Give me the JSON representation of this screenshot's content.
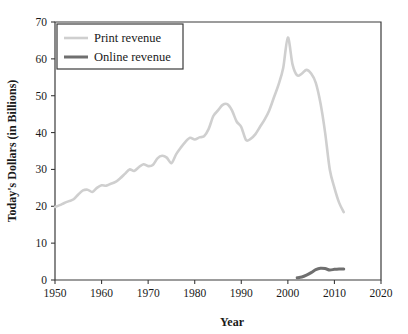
{
  "chart_data": {
    "type": "line",
    "title": "",
    "xlabel": "Year",
    "ylabel": "Today's Dollars (in Billions)",
    "xlim": [
      1950,
      2020
    ],
    "ylim": [
      0,
      70
    ],
    "xticks": [
      1950,
      1960,
      1970,
      1980,
      1990,
      2000,
      2010,
      2020
    ],
    "xtick_labels": [
      "1950",
      "1960",
      "1970",
      "1980",
      "1990",
      "2000",
      "2010",
      "2020"
    ],
    "yticks": [
      0,
      10,
      20,
      30,
      40,
      50,
      60,
      70
    ],
    "ytick_labels": [
      "0",
      "10",
      "20",
      "30",
      "40",
      "50",
      "60",
      "70"
    ],
    "grid": false,
    "legend_position": "upper-left",
    "series": [
      {
        "name": "Print revenue",
        "color": "#cfcfcf",
        "width": 2.6,
        "x": [
          1950,
          1951,
          1952,
          1953,
          1954,
          1955,
          1956,
          1957,
          1958,
          1959,
          1960,
          1961,
          1962,
          1963,
          1964,
          1965,
          1966,
          1967,
          1968,
          1969,
          1970,
          1971,
          1972,
          1973,
          1974,
          1975,
          1976,
          1977,
          1978,
          1979,
          1980,
          1981,
          1982,
          1983,
          1984,
          1985,
          1986,
          1987,
          1988,
          1989,
          1990,
          1991,
          1992,
          1993,
          1994,
          1995,
          1996,
          1997,
          1998,
          1999,
          2000,
          2001,
          2002,
          2003,
          2004,
          2005,
          2006,
          2007,
          2008,
          2009,
          2010,
          2011,
          2012
        ],
        "y": [
          19.8,
          20.3,
          20.9,
          21.4,
          21.9,
          23.2,
          24.3,
          24.5,
          23.9,
          25.0,
          25.7,
          25.6,
          26.1,
          26.6,
          27.6,
          28.8,
          30.0,
          29.6,
          30.6,
          31.4,
          30.9,
          31.2,
          33.0,
          33.7,
          33.2,
          31.7,
          34.1,
          35.9,
          37.5,
          38.6,
          38.1,
          38.7,
          39.0,
          41.0,
          44.5,
          46.0,
          47.5,
          47.7,
          46.0,
          43.0,
          41.5,
          38.0,
          38.3,
          39.5,
          41.5,
          43.5,
          46.0,
          49.5,
          53.0,
          57.5,
          65.8,
          58.5,
          55.5,
          56.0,
          57.0,
          56.0,
          53.5,
          48.0,
          40.0,
          30.0,
          25.0,
          21.0,
          18.4
        ]
      },
      {
        "name": "Online revenue",
        "color": "#6f6f6f",
        "width": 3.0,
        "x": [
          2002,
          2003,
          2004,
          2005,
          2006,
          2007,
          2008,
          2009,
          2010,
          2011,
          2012
        ],
        "y": [
          0.6,
          0.8,
          1.3,
          2.0,
          2.8,
          3.2,
          3.1,
          2.7,
          2.9,
          3.0,
          3.0
        ]
      }
    ]
  },
  "legend": {
    "entries": [
      {
        "label": "Print revenue"
      },
      {
        "label": "Online revenue"
      }
    ]
  }
}
